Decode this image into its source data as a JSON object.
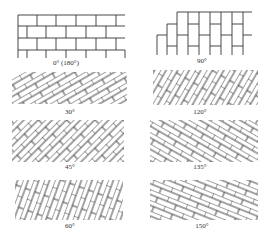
{
  "panels": [
    {
      "id": "p0",
      "label": "0° (180°)",
      "angle": 0
    },
    {
      "id": "p90",
      "label": "90°",
      "angle": 90
    },
    {
      "id": "p30",
      "label": "30°",
      "angle": 30
    },
    {
      "id": "p120",
      "label": "120°",
      "angle": 120
    },
    {
      "id": "p45",
      "label": "45°",
      "angle": 45
    },
    {
      "id": "p135",
      "label": "135°",
      "angle": 135
    },
    {
      "id": "p60",
      "label": "60°",
      "angle": 60
    },
    {
      "id": "p150",
      "label": "150°",
      "angle": 150
    }
  ],
  "colors": {
    "stroke": "#333333",
    "background": "#ffffff"
  }
}
